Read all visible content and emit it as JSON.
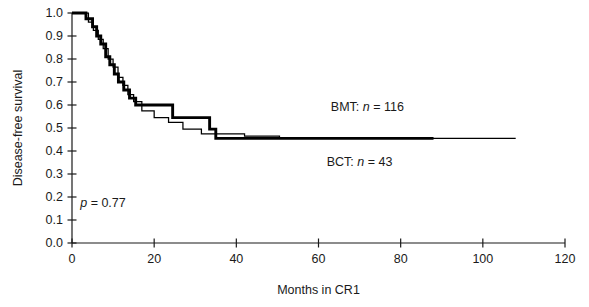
{
  "chart_data": {
    "type": "line",
    "title": "",
    "xlabel": "Months in CR1",
    "ylabel": "Disease-free survival",
    "xlim": [
      0,
      120
    ],
    "ylim": [
      0.0,
      1.0
    ],
    "xticks": [
      0,
      20,
      40,
      60,
      80,
      100,
      120
    ],
    "xtick_labels": [
      "0",
      "20",
      "40",
      "60",
      "80",
      "100",
      "120"
    ],
    "yticks": [
      0.0,
      0.1,
      0.2,
      0.3,
      0.4,
      0.5,
      0.6,
      0.7,
      0.8,
      0.9,
      1.0
    ],
    "ytick_labels": [
      "0.0",
      "0.1",
      "0.2",
      "0.3",
      "0.4",
      "0.5",
      "0.6",
      "0.7",
      "0.8",
      "0.9",
      "1.0"
    ],
    "grid": false,
    "legend_position": "inline-annotation",
    "annotations": [
      {
        "id": "pvalue",
        "text_plain": "p = 0.77",
        "italic_part": "p",
        "rest": " = 0.77",
        "x_month": 2,
        "y_value": 0.155
      },
      {
        "id": "bmt-label",
        "text_plain": "BMT: n = 116",
        "prefix": "BMT: ",
        "italic_part": "n",
        "rest": " = 116",
        "x_month": 63,
        "y_value": 0.575
      },
      {
        "id": "bct-label",
        "text_plain": "BCT: n = 43",
        "prefix": "BCT: ",
        "italic_part": "n",
        "rest": " = 43",
        "x_month": 62,
        "y_value": 0.335
      }
    ],
    "series": [
      {
        "name": "BMT",
        "n": 116,
        "line_weight": "thick",
        "color": "#000000",
        "steps": [
          [
            0,
            1.0
          ],
          [
            3.4,
            1.0
          ],
          [
            3.4,
            0.975
          ],
          [
            5.0,
            0.975
          ],
          [
            5.0,
            0.94
          ],
          [
            6.0,
            0.94
          ],
          [
            6.0,
            0.9
          ],
          [
            7.0,
            0.9
          ],
          [
            7.0,
            0.865
          ],
          [
            8.2,
            0.865
          ],
          [
            8.2,
            0.81
          ],
          [
            9.2,
            0.81
          ],
          [
            9.2,
            0.775
          ],
          [
            10.3,
            0.775
          ],
          [
            10.3,
            0.735
          ],
          [
            11.3,
            0.735
          ],
          [
            11.3,
            0.7
          ],
          [
            12.6,
            0.7
          ],
          [
            12.6,
            0.665
          ],
          [
            14.0,
            0.665
          ],
          [
            14.0,
            0.63
          ],
          [
            15.5,
            0.63
          ],
          [
            15.5,
            0.6
          ],
          [
            24.5,
            0.6
          ],
          [
            24.5,
            0.545
          ],
          [
            33.5,
            0.545
          ],
          [
            33.5,
            0.495
          ],
          [
            35.0,
            0.495
          ],
          [
            35.0,
            0.455
          ],
          [
            88.0,
            0.455
          ]
        ]
      },
      {
        "name": "BCT",
        "n": 43,
        "line_weight": "thin",
        "color": "#000000",
        "steps": [
          [
            0,
            1.0
          ],
          [
            4.0,
            1.0
          ],
          [
            4.0,
            0.96
          ],
          [
            5.2,
            0.96
          ],
          [
            5.2,
            0.925
          ],
          [
            6.4,
            0.925
          ],
          [
            6.4,
            0.885
          ],
          [
            7.6,
            0.885
          ],
          [
            7.6,
            0.845
          ],
          [
            8.8,
            0.845
          ],
          [
            8.8,
            0.8
          ],
          [
            10.0,
            0.8
          ],
          [
            10.0,
            0.765
          ],
          [
            11.2,
            0.765
          ],
          [
            11.2,
            0.72
          ],
          [
            12.4,
            0.72
          ],
          [
            12.4,
            0.685
          ],
          [
            13.6,
            0.685
          ],
          [
            13.6,
            0.645
          ],
          [
            15.0,
            0.645
          ],
          [
            15.0,
            0.615
          ],
          [
            17.0,
            0.615
          ],
          [
            17.0,
            0.575
          ],
          [
            20.0,
            0.575
          ],
          [
            20.0,
            0.545
          ],
          [
            23.5,
            0.545
          ],
          [
            23.5,
            0.525
          ],
          [
            27.0,
            0.525
          ],
          [
            27.0,
            0.495
          ],
          [
            31.5,
            0.495
          ],
          [
            31.5,
            0.475
          ],
          [
            42.0,
            0.475
          ],
          [
            42.0,
            0.465
          ],
          [
            50.5,
            0.465
          ],
          [
            50.5,
            0.455
          ],
          [
            108.0,
            0.455
          ]
        ]
      }
    ]
  },
  "axes": {
    "x_title": "Months in CR1",
    "y_title": "Disease-free survival"
  }
}
